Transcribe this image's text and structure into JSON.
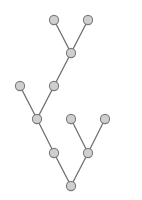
{
  "diagram": {
    "type": "binary-tree",
    "orientation": "root-at-bottom",
    "colors": {
      "node_fill": "#cfcfcf",
      "node_stroke": "#7a7a7a",
      "edge": "#6e6e6e",
      "background": "#ffffff"
    },
    "node_radius": 4.6,
    "nodes": [
      {
        "id": "n0",
        "x": 71,
        "y": 186
      },
      {
        "id": "n1",
        "x": 54,
        "y": 153
      },
      {
        "id": "n2",
        "x": 88,
        "y": 153
      },
      {
        "id": "n3",
        "x": 37,
        "y": 119
      },
      {
        "id": "n4",
        "x": 71,
        "y": 119
      },
      {
        "id": "n5",
        "x": 105,
        "y": 119
      },
      {
        "id": "n6",
        "x": 20,
        "y": 86
      },
      {
        "id": "n7",
        "x": 54,
        "y": 86
      },
      {
        "id": "n8",
        "x": 71,
        "y": 53
      },
      {
        "id": "n9",
        "x": 54,
        "y": 20
      },
      {
        "id": "n10",
        "x": 88,
        "y": 20
      }
    ],
    "edges": [
      [
        "n0",
        "n1"
      ],
      [
        "n0",
        "n2"
      ],
      [
        "n1",
        "n3"
      ],
      [
        "n2",
        "n4"
      ],
      [
        "n2",
        "n5"
      ],
      [
        "n3",
        "n6"
      ],
      [
        "n3",
        "n7"
      ],
      [
        "n7",
        "n8"
      ],
      [
        "n8",
        "n9"
      ],
      [
        "n8",
        "n10"
      ]
    ]
  }
}
